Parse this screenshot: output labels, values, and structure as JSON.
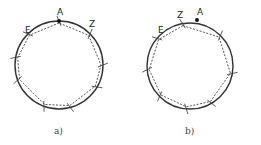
{
  "figures": [
    {
      "id": "a",
      "caption": "a)",
      "circle": {
        "cx": 59,
        "cy": 65,
        "r": 44
      },
      "labels": [
        {
          "text": "A",
          "x": 57,
          "y": 15
        },
        {
          "text": "E",
          "x": 25,
          "y": 33
        },
        {
          "text": "Z",
          "x": 89,
          "y": 27
        }
      ],
      "marked_point": {
        "x": 59,
        "y": 21
      },
      "ticks_deg": [
        -90,
        -45,
        -135,
        0,
        -170,
        160,
        110,
        75,
        30
      ],
      "polygon_deg": [
        -90,
        -135,
        -170,
        160,
        110,
        75,
        30,
        0,
        -45
      ]
    },
    {
      "id": "b",
      "caption": "b)",
      "circle": {
        "cx": 190,
        "cy": 66,
        "r": 43
      },
      "labels": [
        {
          "text": "Z",
          "x": 177,
          "y": 18
        },
        {
          "text": "A",
          "x": 197,
          "y": 15
        },
        {
          "text": "E",
          "x": 158,
          "y": 33
        }
      ],
      "marked_point": {
        "x": 197,
        "y": 20
      },
      "ticks_deg": [
        -100,
        -140,
        -45,
        10,
        60,
        95,
        135,
        175
      ],
      "polygon_deg": [
        -100,
        -140,
        175,
        135,
        95,
        60,
        10,
        -45
      ]
    }
  ],
  "colors": {
    "stroke": "#333333",
    "dashed": "#444444"
  }
}
